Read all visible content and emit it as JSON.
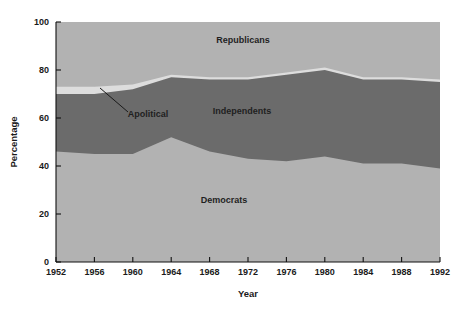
{
  "chart_data": {
    "type": "area",
    "title": "",
    "subtitle": "",
    "xlabel": "Year",
    "ylabel": "Percentage",
    "xlim": [
      1952,
      1992
    ],
    "ylim": [
      0,
      100
    ],
    "grid": false,
    "legend_position": "inline-annotations",
    "stacked": true,
    "x": [
      1952,
      1956,
      1960,
      1964,
      1968,
      1972,
      1976,
      1980,
      1984,
      1988,
      1992
    ],
    "xticks": [
      "1952",
      "1956",
      "1960",
      "1964",
      "1968",
      "1972",
      "1976",
      "1980",
      "1984",
      "1988",
      "1992"
    ],
    "yticks": [
      "0",
      "20",
      "40",
      "60",
      "80",
      "100"
    ],
    "ytick_values": [
      0,
      20,
      40,
      60,
      80,
      100
    ],
    "series": [
      {
        "name": "Democrats",
        "color": "#b2b2b2",
        "values": [
          46,
          45,
          45,
          52,
          46,
          43,
          42,
          44,
          41,
          41,
          39
        ]
      },
      {
        "name": "Independents",
        "color": "#6b6b6b",
        "values": [
          24,
          25,
          27,
          25,
          30,
          33,
          36,
          36,
          35,
          35,
          36
        ]
      },
      {
        "name": "Apolitical",
        "color": "#dddddd",
        "values": [
          3,
          3,
          2,
          1,
          1,
          1,
          1,
          1,
          1,
          1,
          1
        ]
      },
      {
        "name": "Republicans",
        "color": "#b2b2b2",
        "values": [
          27,
          27,
          26,
          22,
          23,
          23,
          21,
          19,
          23,
          23,
          24
        ]
      }
    ],
    "cumulative_upper_bounds": {
      "democrats_top": [
        46,
        45,
        45,
        52,
        46,
        43,
        42,
        44,
        41,
        41,
        39
      ],
      "independents_top": [
        70,
        70,
        72,
        77,
        76,
        76,
        78,
        80,
        76,
        76,
        75
      ],
      "apolitical_top": [
        73,
        73,
        74,
        78,
        77,
        77,
        79,
        81,
        77,
        77,
        76
      ]
    },
    "annotations": [
      {
        "label": "Republicans",
        "x_px": 243,
        "y_px": 43
      },
      {
        "label": "Independents",
        "x_px": 242,
        "y_px": 114
      },
      {
        "label": "Democrats",
        "x_px": 224,
        "y_px": 203
      },
      {
        "label": "Apolitical",
        "x_px": 148,
        "y_px": 117
      }
    ]
  }
}
